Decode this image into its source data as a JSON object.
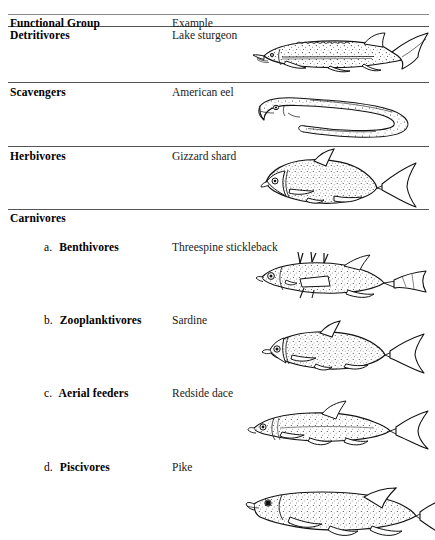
{
  "document": {
    "type": "table",
    "title_fragment_cropped": "",
    "columns": {
      "group_header": "Functional Group",
      "example_header": "Example"
    },
    "rows": [
      {
        "group": "Detritivores",
        "example": "Lake  sturgeon",
        "illustration": "sturgeon-illustration",
        "indent": "none"
      },
      {
        "group": "Scavengers",
        "example": "American eel",
        "illustration": "eel-illustration",
        "indent": "none"
      },
      {
        "group": "Herbivores",
        "example": "Gizzard shard",
        "illustration": "shad-illustration",
        "indent": "none"
      },
      {
        "group": "Carnivores",
        "example": "",
        "illustration": "",
        "indent": "none"
      },
      {
        "group": "a. Benthivores",
        "letter": "a.",
        "name": "Benthivores",
        "example": "Threespine stickleback",
        "illustration": "stickleback-illustration",
        "indent": "sub"
      },
      {
        "group": "b. Zooplanktivores",
        "letter": "b.",
        "name": "Zooplanktivores",
        "example": "Sardine",
        "illustration": "sardine-illustration",
        "indent": "sub"
      },
      {
        "group": "c. Aerial feeders",
        "letter": "c.",
        "name": "Aerial feeders",
        "example": "Redside dace",
        "illustration": "dace-illustration",
        "indent": "sub"
      },
      {
        "group": "d. Piscivores",
        "letter": "d.",
        "name": "Piscivores",
        "example": "Pike",
        "illustration": "pike-illustration",
        "indent": "sub"
      }
    ],
    "colors": {
      "ink": "#000000",
      "rule": "#555555",
      "paper": "#ffffff"
    }
  }
}
